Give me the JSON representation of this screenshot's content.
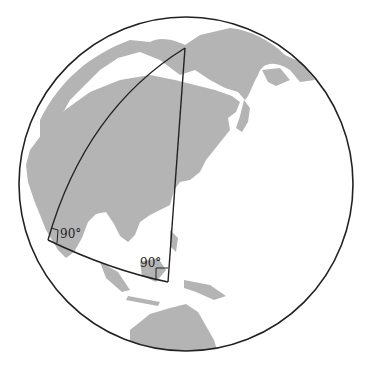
{
  "diagram": {
    "type": "spherical-triangle-on-globe",
    "globe": {
      "cx": 186,
      "cy": 184,
      "r": 167,
      "ocean_color": "#ffffff",
      "land_color": "#b4b4b4",
      "outline_color": "#222222"
    },
    "triangle": {
      "vertices": {
        "top": [
          185,
          48
        ],
        "left": [
          48,
          240
        ],
        "bottom_right": [
          168,
          282
        ]
      },
      "stroke": "#222222"
    },
    "angle_labels": [
      {
        "text": "90°",
        "x": 60,
        "y": 238
      },
      {
        "text": "90°",
        "x": 140,
        "y": 267
      }
    ]
  }
}
